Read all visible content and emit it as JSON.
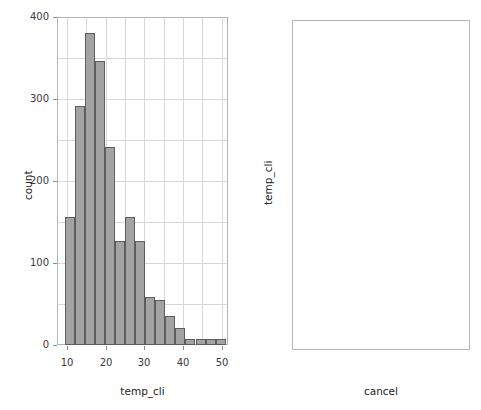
{
  "figure": {
    "width": 481,
    "height": 410,
    "background": "#ffffff",
    "bar_fill": "#a3a3a3",
    "bar_edge": "#5d5d5d",
    "grid_color": "#d8d8d8",
    "frame_color": "#b5b5b5",
    "outlier_color": "#1a1a1a"
  },
  "chart_data": [
    {
      "type": "bar",
      "name": "histogram-temp-cli",
      "title": "",
      "xlabel": "temp_cli",
      "ylabel": "count",
      "xlim": [
        7.4,
        51.6
      ],
      "ylim": [
        0,
        400
      ],
      "grid": true,
      "xticks": [
        10,
        20,
        30,
        40,
        50
      ],
      "xtick_labels": [
        "10",
        "20",
        "30",
        "40",
        "50"
      ],
      "yticks": [
        0,
        100,
        200,
        300,
        400
      ],
      "ytick_labels": [
        "0",
        "100",
        "200",
        "300",
        "400"
      ],
      "bin_width": 2.6,
      "bin_edges": [
        9.4,
        12.0,
        14.6,
        17.2,
        19.8,
        22.4,
        25.0,
        27.6,
        30.2,
        32.8,
        35.4,
        38.0,
        40.6,
        43.2,
        45.8,
        48.4,
        51.0
      ],
      "categories": [
        "9.4-12.0",
        "12.0-14.6",
        "14.6-17.2",
        "17.2-19.8",
        "19.8-22.4",
        "22.4-25.0",
        "25.0-27.6",
        "27.6-30.2",
        "30.2-32.8",
        "32.8-35.4",
        "35.4-38.0",
        "38.0-40.6",
        "40.6-43.2",
        "43.2-45.8",
        "45.8-48.4",
        "48.4-51.0"
      ],
      "values": [
        156,
        291,
        381,
        346,
        242,
        127,
        156,
        127,
        58,
        55,
        35,
        21,
        7,
        7,
        7,
        7
      ]
    },
    {
      "type": "box",
      "name": "boxplot-temp-cli-by-cancel",
      "title": "",
      "xlabel": "cancel",
      "ylabel": "temp_cli",
      "ylim": [
        12.2,
        51.5
      ],
      "grid": true,
      "yticks": [
        20,
        30,
        40,
        50
      ],
      "ytick_labels": [
        "20",
        "30",
        "40",
        "50"
      ],
      "categories": [
        "nao",
        "sim"
      ],
      "boxes": [
        {
          "label": "nao",
          "q1": 16.5,
          "median": 20.1,
          "q3": 25.8,
          "whisker_low": 13.0,
          "whisker_high": 41.0,
          "outliers": [
            41.8,
            43.0,
            43.9,
            44.8,
            45.9,
            47.9,
            48.6,
            50.0
          ]
        },
        {
          "label": "sim",
          "q1": 14.4,
          "median": 16.5,
          "q3": 19.4,
          "whisker_low": 12.8,
          "whisker_high": 28.8,
          "outliers": [
            29.1,
            30.0,
            30.9,
            31.8,
            32.7,
            33.7,
            34.9,
            37.2,
            38.1,
            42.0,
            46.0,
            48.1
          ]
        }
      ]
    }
  ]
}
